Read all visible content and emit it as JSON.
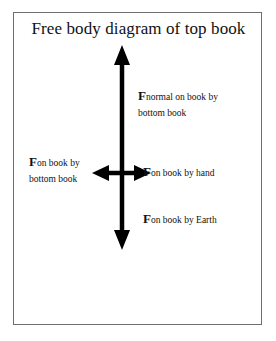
{
  "figure": {
    "title": "Free body diagram of top book",
    "frame": {
      "border_color": "#6e6e72",
      "background": "#ffffff"
    },
    "arrow_color": "#000000",
    "text_color": "#111111"
  },
  "labels": {
    "normal": {
      "symbol": "F",
      "subscript_line1": "normal on book by",
      "subscript_line2": "bottom book"
    },
    "bottom_book": {
      "symbol": "F",
      "subscript_line1": "on book by",
      "subscript_line2": "bottom book"
    },
    "hand": {
      "symbol": "F",
      "subscript_line1": "on book by hand"
    },
    "earth": {
      "symbol": "F",
      "subscript_line1": "on book by Earth"
    }
  },
  "arrows": {
    "up": {
      "name": "normal-force-arrow",
      "direction": "up"
    },
    "down": {
      "name": "weight-force-arrow",
      "direction": "down"
    },
    "left": {
      "name": "bottom-book-force-arrow",
      "direction": "left"
    },
    "right": {
      "name": "hand-force-arrow",
      "direction": "right"
    }
  }
}
